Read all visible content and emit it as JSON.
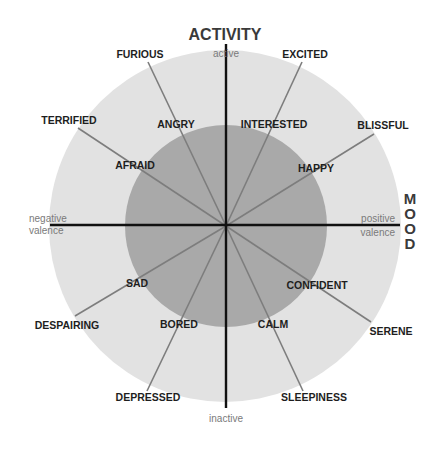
{
  "diagram": {
    "vertical_axis_title": "ACTIVITY",
    "horizontal_axis_title": "MOOD",
    "horizontal_axis_title_letters": [
      "M",
      "O",
      "O",
      "D"
    ],
    "axis_labels": {
      "top": "active",
      "bottom": "inactive",
      "left_line1": "negative",
      "left_line2": "valence",
      "right_line1": "positive",
      "right_line2": "valence"
    },
    "colors": {
      "outer_circle": "#e2e2e2",
      "inner_circle": "#a9a9a9",
      "axis": "#111111",
      "spoke": "#7d7d7d",
      "label": "#1e1e1e",
      "axis_label": "#7a7a7a"
    },
    "inner_emotions": [
      "ANGRY",
      "INTERESTED",
      "AFRAID",
      "HAPPY",
      "SAD",
      "CONFIDENT",
      "BORED",
      "CALM"
    ],
    "outer_emotions": [
      "FURIOUS",
      "EXCITED",
      "TERRIFIED",
      "BLISSFUL",
      "DESPAIRING",
      "SERENE",
      "DEPRESSED",
      "SLEEPINESS"
    ],
    "labels": {
      "furious": "FURIOUS",
      "excited": "EXCITED",
      "terrified": "TERRIFIED",
      "blissful": "BLISSFUL",
      "angry": "ANGRY",
      "interested": "INTERESTED",
      "afraid": "AFRAID",
      "happy": "HAPPY",
      "sad": "SAD",
      "confident": "CONFIDENT",
      "despairing": "DESPAIRING",
      "serene": "SERENE",
      "bored": "BORED",
      "calm": "CALM",
      "depressed": "DEPRESSED",
      "sleepiness": "SLEEPINESS"
    }
  }
}
